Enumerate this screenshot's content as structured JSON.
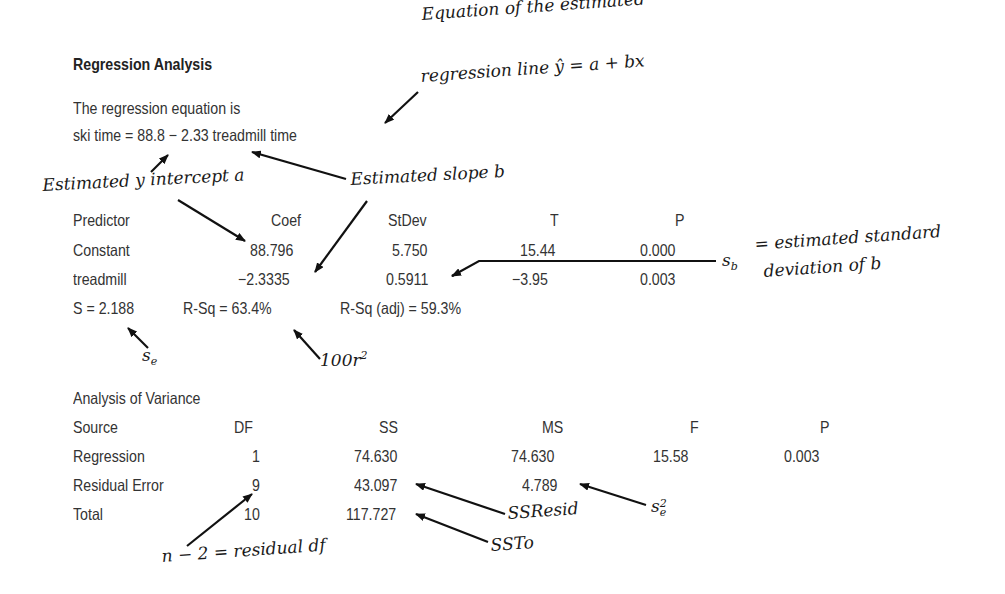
{
  "title": "Regression Analysis",
  "equation_intro": "The regression equation is",
  "equation": "ski time = 88.8 − 2.33 treadmill time",
  "coef_table": {
    "headers": [
      "Predictor",
      "Coef",
      "StDev",
      "T",
      "P"
    ],
    "rows": [
      {
        "predictor": "Constant",
        "coef": "88.796",
        "stdev": "5.750",
        "t": "15.44",
        "p": "0.000"
      },
      {
        "predictor": "treadmill",
        "coef": "−2.3335",
        "stdev": "0.5911",
        "t": "−3.95",
        "p": "0.003"
      }
    ]
  },
  "fit_stats": {
    "s": "S = 2.188",
    "rsq": "R-Sq = 63.4%",
    "rsq_adj": "R-Sq (adj) = 59.3%"
  },
  "anova": {
    "title": "Analysis of Variance",
    "headers": [
      "Source",
      "DF",
      "SS",
      "MS",
      "F",
      "P"
    ],
    "rows": [
      {
        "source": "Regression",
        "df": "1",
        "ss": "74.630",
        "ms": "74.630",
        "f": "15.58",
        "p": "0.003"
      },
      {
        "source": "Residual Error",
        "df": "9",
        "ss": "43.097",
        "ms": "4.789",
        "f": "",
        "p": ""
      },
      {
        "source": "Total",
        "df": "10",
        "ss": "117.727",
        "ms": "",
        "f": "",
        "p": ""
      }
    ]
  },
  "annotations": {
    "equation_line_1": "Equation of the estimated",
    "equation_line_2": "regression line ŷ = a + bx",
    "intercept": "Estimated y intercept a",
    "slope": "Estimated slope b",
    "sb_symbol": "s",
    "sb_sub": "b",
    "sb_text_1": "= estimated standard",
    "sb_text_2": "deviation of b",
    "se_symbol": "s",
    "se_sub": "e",
    "r2_text": "100r",
    "r2_sup": "2",
    "ssresid": "SSResid",
    "ssto": "SSTo",
    "se2_symbol": "s",
    "se2_sub": "e",
    "se2_sup": "2",
    "residual_df": "n − 2 = residual df"
  }
}
